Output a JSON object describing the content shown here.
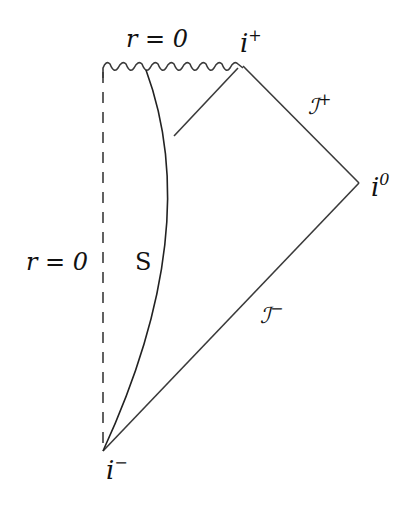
{
  "diagram": {
    "type": "penrose-diagram",
    "labels": {
      "singularity_top": "r = 0",
      "axis_left": "r = 0",
      "region": "S",
      "future_timelike_infinity": "i",
      "future_timelike_sup": "+",
      "spatial_infinity": "i",
      "spatial_sup": "0",
      "past_timelike_infinity": "i",
      "past_timelike_sup": "−",
      "future_null_infinity": "ℐ",
      "future_null_sup": "+",
      "past_null_infinity": "ℐ",
      "past_null_sup": "−"
    },
    "colors": {
      "line": "#3a3a3a",
      "text": "#111111"
    }
  }
}
